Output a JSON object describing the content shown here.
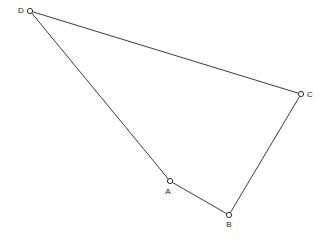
{
  "figure": {
    "kind": "geometry-diagram",
    "shape_name": "quadrilateral-ABCD",
    "width": 328,
    "height": 245,
    "background_color": "#ffffff",
    "line_color": "#3b3b44",
    "marker_fill_color": "#ffffff",
    "marker_stroke_color": "#2e2e36",
    "label_color": "#17171c",
    "vertices": [
      {
        "id": "A",
        "label": "A",
        "x": 170,
        "y": 181,
        "label_x": 168,
        "label_y": 188,
        "label_position": "below"
      },
      {
        "id": "B",
        "label": "B",
        "x": 229,
        "y": 215,
        "label_x": 229,
        "label_y": 221,
        "label_position": "below"
      },
      {
        "id": "C",
        "label": "C",
        "x": 301,
        "y": 94,
        "label_x": 307,
        "label_y": 95,
        "label_position": "right"
      },
      {
        "id": "D",
        "label": "D",
        "x": 30,
        "y": 11,
        "label_x": 24,
        "label_y": 11,
        "label_position": "left"
      }
    ],
    "edges": [
      {
        "id": "edge-DA",
        "from": "D",
        "to": "A",
        "path": "M 30 11 L 170 181"
      },
      {
        "id": "edge-AB",
        "from": "A",
        "to": "B",
        "path": "M 170 181 L 229 215"
      },
      {
        "id": "edge-BC",
        "from": "B",
        "to": "C",
        "path": "M 229 215 L 301 94"
      },
      {
        "id": "edge-CD",
        "from": "C",
        "to": "D",
        "path": "M 301 94 L 30 11"
      }
    ],
    "marker_radius": 2.6
  }
}
